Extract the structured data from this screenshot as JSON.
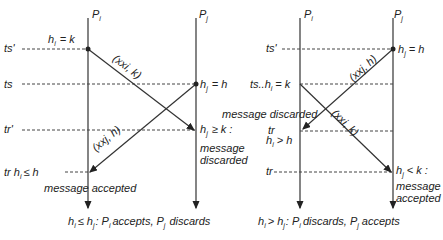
{
  "left": {
    "process_i": "P",
    "process_j": "P",
    "sub_i": "i",
    "sub_j": "j",
    "ts_prime": "ts'",
    "ts": "ts",
    "tr_prime": "tr'",
    "tr_label": "tr h",
    "tr_cond": "≤ h",
    "hi_eq": "h",
    "hi_eq_rest": "= k",
    "hj_eq": "h",
    "hj_eq_rest": "= h",
    "msg1": "(xxi, k)",
    "msg2": "(xxj, h)",
    "hj_ge": "h",
    "hj_ge_rest": "≥ k :",
    "discarded_1": "message",
    "discarded_2": "discarded",
    "accepted": "message accepted",
    "caption_a": "h",
    "caption_b": "≤ h",
    "caption_c": ": P",
    "caption_d": "accepts, P",
    "caption_e": "discards"
  },
  "right": {
    "process_i": "P",
    "process_j": "P",
    "ts_prime": "ts'",
    "ts_hi": "ts..h",
    "ts_hi_rest": "= k",
    "hj_eq": "h",
    "hj_eq_rest": "= h",
    "msg_j": "(xxj, h)",
    "msg_i": "(xxi, k)",
    "discarded": "message discarded",
    "tr_top": "tr",
    "hi_gt": "h",
    "hi_gt_rest": "> h",
    "tr": "tr",
    "hj_lt": "h",
    "hj_lt_rest": "< k :",
    "accepted_1": "message",
    "accepted_2": "accepted",
    "caption_a": "h",
    "caption_b": "> h",
    "caption_c": ": P",
    "caption_d": "discards, P",
    "caption_e": "accepts"
  }
}
